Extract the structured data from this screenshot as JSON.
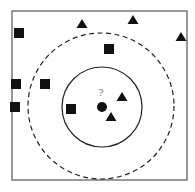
{
  "diagram": {
    "type": "knn-classification",
    "query_label": "?",
    "colors": {
      "ink": "#111111",
      "frame": "#555555",
      "label": "#777777"
    },
    "frame": {
      "x": 12,
      "y": 11,
      "w": 175,
      "h": 169
    },
    "inner_circle": {
      "cx": 102,
      "cy": 107,
      "r": 40,
      "style": "solid"
    },
    "outer_circle": {
      "cx": 101,
      "cy": 106,
      "r": 73,
      "style": "dashed"
    },
    "query_point": {
      "shape": "circle",
      "x": 102,
      "y": 107
    },
    "squares": [
      {
        "x": 19,
        "y": 33
      },
      {
        "x": 109,
        "y": 49
      },
      {
        "x": 16,
        "y": 84
      },
      {
        "x": 45,
        "y": 84
      },
      {
        "x": 15,
        "y": 107
      },
      {
        "x": 71,
        "y": 109
      }
    ],
    "triangles": [
      {
        "x": 82,
        "y": 24
      },
      {
        "x": 133,
        "y": 20
      },
      {
        "x": 181,
        "y": 37
      },
      {
        "x": 122,
        "y": 97
      },
      {
        "x": 111,
        "y": 117
      }
    ]
  }
}
